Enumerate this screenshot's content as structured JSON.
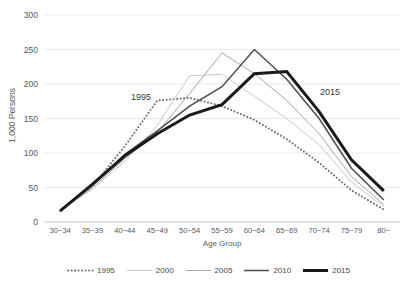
{
  "chart_data": {
    "type": "line",
    "title": "",
    "xlabel": "Age Group",
    "ylabel": "1,000 Persons",
    "ylim": [
      0,
      300
    ],
    "ytick_step": 50,
    "yticks": [
      300,
      250,
      200,
      150,
      100,
      50,
      0
    ],
    "grid": true,
    "grid_axis": "y",
    "legend_position": "bottom",
    "categories": [
      "30~34",
      "35~39",
      "40~44",
      "45~49",
      "50~54",
      "55~59",
      "60~64",
      "65~69",
      "70~74",
      "75~79",
      "80~"
    ],
    "series": [
      {
        "name": "1995",
        "style": "dotted",
        "color": "#6f6f6f",
        "values": [
          16,
          52,
          110,
          176,
          180,
          168,
          148,
          120,
          86,
          46,
          18
        ]
      },
      {
        "name": "2000",
        "style": "solid-thin",
        "color": "#c9c9c9",
        "values": [
          16,
          48,
          88,
          140,
          212,
          214,
          182,
          150,
          112,
          58,
          22
        ]
      },
      {
        "name": "2005",
        "style": "solid-thin",
        "color": "#a6a6a6",
        "values": [
          16,
          50,
          92,
          130,
          186,
          245,
          215,
          176,
          128,
          66,
          25
        ]
      },
      {
        "name": "2010",
        "style": "solid-medium",
        "color": "#4d4d4d",
        "values": [
          16,
          54,
          98,
          132,
          168,
          196,
          250,
          207,
          150,
          78,
          32
        ]
      },
      {
        "name": "2015",
        "style": "solid-thick",
        "color": "#1a1a1a",
        "values": [
          16,
          55,
          96,
          128,
          155,
          170,
          215,
          218,
          160,
          90,
          45
        ]
      }
    ],
    "annotations": [
      {
        "text": "1995",
        "x_px": 131,
        "y_px": 92
      },
      {
        "text": "2015",
        "x_px": 320,
        "y_px": 87
      }
    ]
  },
  "legend": {
    "items": [
      {
        "label": "1995"
      },
      {
        "label": "2000"
      },
      {
        "label": "2005"
      },
      {
        "label": "2010"
      },
      {
        "label": "2015"
      }
    ]
  }
}
